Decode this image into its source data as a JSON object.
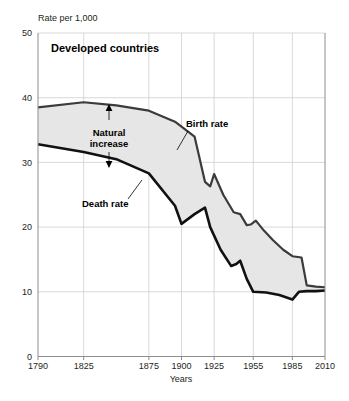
{
  "chart_data": {
    "type": "line",
    "title": "Developed countries",
    "xlabel": "Years",
    "ylabel": "Rate per 1,000",
    "xlim": [
      1790,
      2010
    ],
    "ylim": [
      0,
      50
    ],
    "grid": true,
    "legend_position": "inline-annotations",
    "x_tick_labels": [
      "1790",
      "1825",
      "1875",
      "1900",
      "1925",
      "1955",
      "1985",
      "2010"
    ],
    "x_ticks": [
      1790,
      1825,
      1875,
      1900,
      1925,
      1955,
      1985,
      2010
    ],
    "y_tick_labels": [
      "0",
      "10",
      "20",
      "30",
      "40",
      "50"
    ],
    "y_ticks": [
      0,
      10,
      20,
      30,
      40,
      50
    ],
    "annotations": [
      {
        "text": "Natural increase",
        "line1": "Natural",
        "line2": "increase"
      },
      {
        "text": "Birth rate"
      },
      {
        "text": "Death rate"
      }
    ],
    "fill_label": "Natural increase",
    "fill_color": "#e6e6e6",
    "series": [
      {
        "name": "Birth rate",
        "color": "#3b3b3b",
        "x": [
          1790,
          1825,
          1850,
          1875,
          1895,
          1910,
          1918,
          1922,
          1925,
          1932,
          1940,
          1945,
          1950,
          1953,
          1957,
          1963,
          1970,
          1978,
          1985,
          1992,
          1996,
          2003,
          2010
        ],
        "values": [
          38.5,
          39.3,
          38.8,
          38.0,
          36.3,
          34.0,
          27.0,
          26.3,
          28.2,
          25.0,
          22.3,
          22.0,
          20.3,
          20.4,
          21.0,
          19.5,
          18.0,
          16.5,
          15.5,
          15.3,
          11.0,
          10.8,
          10.7
        ]
      },
      {
        "name": "Death rate",
        "color": "#111111",
        "x": [
          1790,
          1825,
          1850,
          1875,
          1895,
          1900,
          1910,
          1918,
          1922,
          1930,
          1938,
          1942,
          1945,
          1950,
          1955,
          1965,
          1975,
          1985,
          1990,
          1996,
          2003,
          2010
        ],
        "values": [
          32.8,
          31.6,
          30.5,
          28.3,
          23.3,
          20.5,
          22.0,
          23.0,
          20.0,
          16.5,
          14.0,
          14.3,
          14.8,
          12.0,
          10.0,
          9.9,
          9.5,
          8.8,
          10.0,
          10.1,
          10.1,
          10.2
        ]
      }
    ]
  }
}
